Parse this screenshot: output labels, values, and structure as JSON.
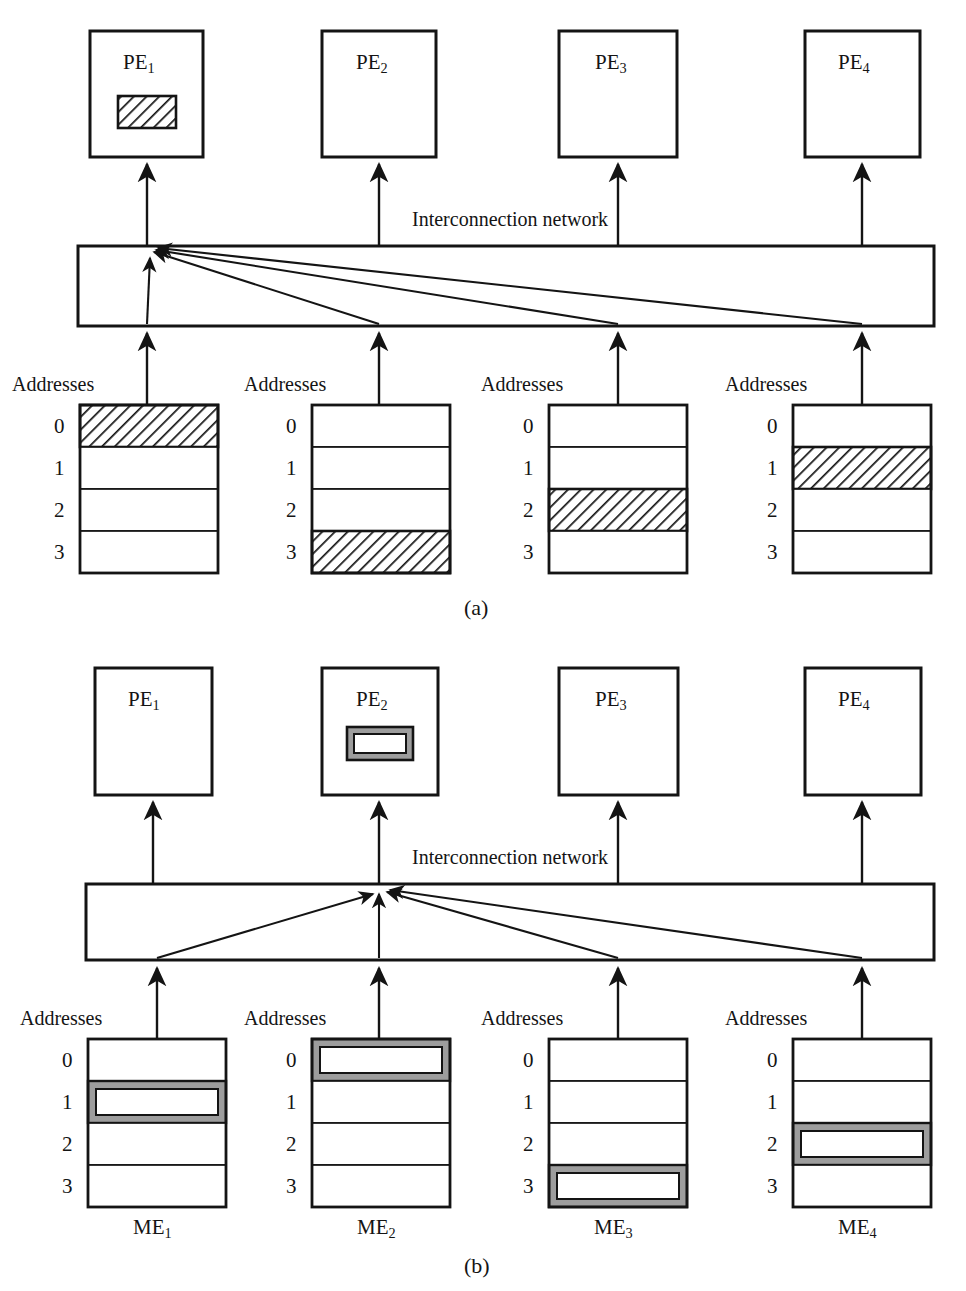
{
  "figure": {
    "type": "diagram",
    "panels": [
      {
        "id": "a",
        "caption": "(a)",
        "network_label": "Interconnection network",
        "addresses_label": "Addresses",
        "address_rows": [
          "0",
          "1",
          "2",
          "3"
        ],
        "pe_units": [
          {
            "label": "PE",
            "index": "1",
            "highlighted": true,
            "highlight_style": "hatched"
          },
          {
            "label": "PE",
            "index": "2",
            "highlighted": false,
            "highlight_style": "none"
          },
          {
            "label": "PE",
            "index": "3",
            "highlighted": false,
            "highlight_style": "none"
          },
          {
            "label": "PE",
            "index": "4",
            "highlighted": false,
            "highlight_style": "none"
          }
        ],
        "memory_units": [
          {
            "label": "ME",
            "index": "1",
            "show_label": false,
            "highlighted_row": 0,
            "highlight_style": "hatched"
          },
          {
            "label": "ME",
            "index": "2",
            "show_label": false,
            "highlighted_row": 3,
            "highlight_style": "hatched"
          },
          {
            "label": "ME",
            "index": "3",
            "show_label": false,
            "highlighted_row": 2,
            "highlight_style": "hatched"
          },
          {
            "label": "ME",
            "index": "4",
            "show_label": false,
            "highlighted_row": 1,
            "highlight_style": "hatched"
          }
        ],
        "routing": {
          "converge_to_pe": 1,
          "description": "all four memory modules route to PE1"
        }
      },
      {
        "id": "b",
        "caption": "(b)",
        "network_label": "Interconnection network",
        "addresses_label": "Addresses",
        "address_rows": [
          "0",
          "1",
          "2",
          "3"
        ],
        "pe_units": [
          {
            "label": "PE",
            "index": "1",
            "highlighted": false,
            "highlight_style": "none"
          },
          {
            "label": "PE",
            "index": "2",
            "highlighted": true,
            "highlight_style": "outlined"
          },
          {
            "label": "PE",
            "index": "3",
            "highlighted": false,
            "highlight_style": "none"
          },
          {
            "label": "PE",
            "index": "4",
            "highlighted": false,
            "highlight_style": "none"
          }
        ],
        "memory_units": [
          {
            "label": "ME",
            "index": "1",
            "show_label": true,
            "highlighted_row": 1,
            "highlight_style": "outlined"
          },
          {
            "label": "ME",
            "index": "2",
            "show_label": true,
            "highlighted_row": 0,
            "highlight_style": "outlined"
          },
          {
            "label": "ME",
            "index": "3",
            "show_label": true,
            "highlighted_row": 3,
            "highlight_style": "outlined"
          },
          {
            "label": "ME",
            "index": "4",
            "show_label": true,
            "highlighted_row": 2,
            "highlight_style": "outlined"
          }
        ],
        "routing": {
          "converge_to_pe": 2,
          "description": "all four memory modules route to PE2"
        }
      }
    ],
    "colors": {
      "stroke": "#141414",
      "background": "#ffffff",
      "hatch": "#141414",
      "outline_fill": "#9d9d9d"
    }
  },
  "panel_a": {
    "caption": "(a)",
    "network_label": "Interconnection network",
    "addresses_label_1": "Addresses",
    "addresses_label_2": "Addresses",
    "addresses_label_3": "Addresses",
    "addresses_label_4": "Addresses",
    "pe1": "PE",
    "pe1_sub": "1",
    "pe2": "PE",
    "pe2_sub": "2",
    "pe3": "PE",
    "pe3_sub": "3",
    "pe4": "PE",
    "pe4_sub": "4",
    "rows": [
      "0",
      "1",
      "2",
      "3"
    ]
  },
  "panel_b": {
    "caption": "(b)",
    "network_label": "Interconnection network",
    "addresses_label_1": "Addresses",
    "addresses_label_2": "Addresses",
    "addresses_label_3": "Addresses",
    "addresses_label_4": "Addresses",
    "pe1": "PE",
    "pe1_sub": "1",
    "pe2": "PE",
    "pe2_sub": "2",
    "pe3": "PE",
    "pe3_sub": "3",
    "pe4": "PE",
    "pe4_sub": "4",
    "me1": "ME",
    "me1_sub": "1",
    "me2": "ME",
    "me2_sub": "2",
    "me3": "ME",
    "me3_sub": "3",
    "me4": "ME",
    "me4_sub": "4",
    "rows": [
      "0",
      "1",
      "2",
      "3"
    ]
  }
}
